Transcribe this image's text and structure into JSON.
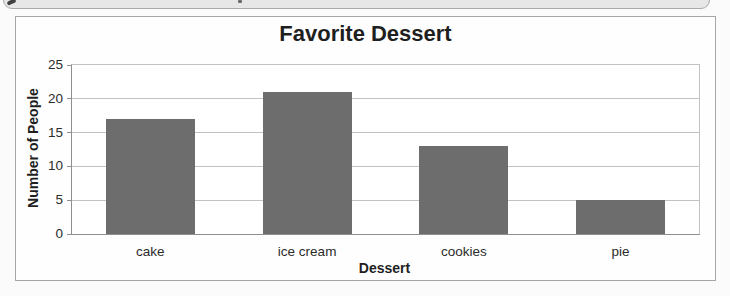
{
  "chart_data": {
    "type": "bar",
    "title": "Favorite Dessert",
    "xlabel": "Dessert",
    "ylabel": "Number of People",
    "categories": [
      "cake",
      "ice cream",
      "cookies",
      "pie"
    ],
    "values": [
      17,
      21,
      13,
      5
    ],
    "ylim": [
      0,
      25
    ],
    "yticks": [
      0,
      5,
      10,
      15,
      20,
      25
    ],
    "grid": true,
    "legend": "none",
    "colors": {
      "bar": "#6d6d6d",
      "gridline": "#c2c2c2",
      "axis": "#8f8f8f",
      "tick_text": "#2b2b2b",
      "title_text": "#1f1f1f",
      "frame_border": "#a6a6a6",
      "top_panel_fill": "#e7e7e7",
      "top_panel_border": "#a9a9a9"
    }
  }
}
